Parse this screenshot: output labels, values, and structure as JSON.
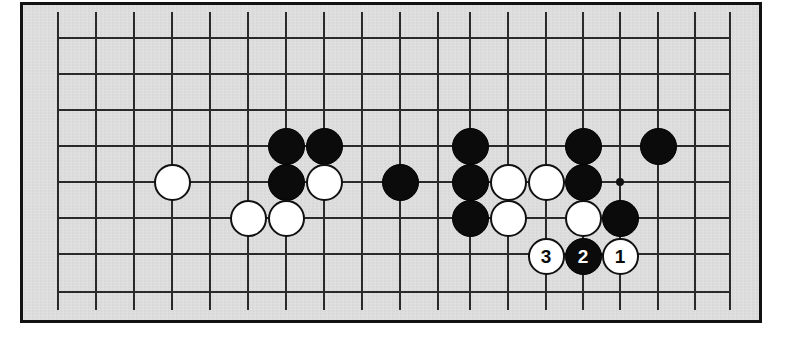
{
  "diagram": {
    "type": "go-board-problem-diagram",
    "board_color": "#dddddd",
    "frame_color": "#121212",
    "line_color": "#2a2a2a",
    "black_stone_color": "#0b0b0b",
    "white_stone_color": "#ffffff",
    "grid": {
      "columns_x": [
        58,
        96,
        134,
        172,
        210,
        248,
        286,
        324,
        362,
        400,
        438,
        470,
        508,
        546,
        583,
        620,
        658,
        695,
        730
      ],
      "rows_y": [
        38,
        74,
        110,
        146,
        182,
        218,
        254,
        292
      ],
      "cell_size": 38,
      "line_width": 2
    },
    "star_points": [
      {
        "name": "hoshi",
        "x": 620,
        "y": 182
      }
    ],
    "stones": [
      {
        "id": "w-a",
        "color": "white",
        "x": 172,
        "y": 182,
        "label": ""
      },
      {
        "id": "b-b1",
        "color": "black",
        "x": 286,
        "y": 146,
        "label": ""
      },
      {
        "id": "b-b2",
        "color": "black",
        "x": 324,
        "y": 146,
        "label": ""
      },
      {
        "id": "b-b3",
        "color": "black",
        "x": 286,
        "y": 182,
        "label": ""
      },
      {
        "id": "w-b4",
        "color": "white",
        "x": 324,
        "y": 182,
        "label": ""
      },
      {
        "id": "w-b5",
        "color": "white",
        "x": 248,
        "y": 218,
        "label": ""
      },
      {
        "id": "w-b6",
        "color": "white",
        "x": 286,
        "y": 218,
        "label": ""
      },
      {
        "id": "b-c1",
        "color": "black",
        "x": 400,
        "y": 182,
        "label": ""
      },
      {
        "id": "b-d1",
        "color": "black",
        "x": 470,
        "y": 146,
        "label": ""
      },
      {
        "id": "b-d2",
        "color": "black",
        "x": 470,
        "y": 182,
        "label": ""
      },
      {
        "id": "b-d3",
        "color": "black",
        "x": 470,
        "y": 218,
        "label": ""
      },
      {
        "id": "w-d4",
        "color": "white",
        "x": 508,
        "y": 182,
        "label": ""
      },
      {
        "id": "w-d5",
        "color": "white",
        "x": 546,
        "y": 182,
        "label": ""
      },
      {
        "id": "w-d6",
        "color": "white",
        "x": 508,
        "y": 218,
        "label": ""
      },
      {
        "id": "b-e1",
        "color": "black",
        "x": 583,
        "y": 146,
        "label": ""
      },
      {
        "id": "b-e2",
        "color": "black",
        "x": 583,
        "y": 182,
        "label": ""
      },
      {
        "id": "w-e3",
        "color": "white",
        "x": 583,
        "y": 218,
        "label": ""
      },
      {
        "id": "b-e4",
        "color": "black",
        "x": 620,
        "y": 218,
        "label": ""
      },
      {
        "id": "b-f1",
        "color": "black",
        "x": 658,
        "y": 146,
        "label": ""
      },
      {
        "id": "move-3",
        "color": "white",
        "x": 546,
        "y": 256,
        "label": "3"
      },
      {
        "id": "move-2",
        "color": "black",
        "x": 583,
        "y": 256,
        "label": "2"
      },
      {
        "id": "move-1",
        "color": "white",
        "x": 620,
        "y": 256,
        "label": "1"
      }
    ],
    "move_labels": [
      "3",
      "2",
      "1"
    ]
  }
}
